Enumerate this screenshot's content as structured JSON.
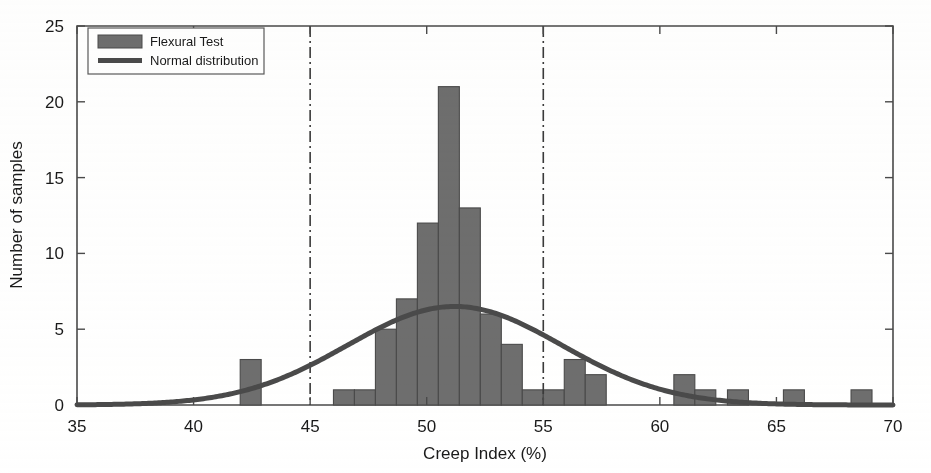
{
  "chart_data": {
    "type": "bar",
    "title": "",
    "subtitle": "",
    "xlabel": "Creep Index (%)",
    "ylabel": "Number of samples",
    "xlim": [
      35,
      70
    ],
    "ylim": [
      0,
      25
    ],
    "xticks": [
      35,
      40,
      45,
      50,
      55,
      60,
      65,
      70
    ],
    "xticklabels": [
      "35",
      "40",
      "45",
      "50",
      "55",
      "60",
      "65",
      "70"
    ],
    "yticks": [
      0,
      5,
      10,
      15,
      20,
      25
    ],
    "yticklabels": [
      "0",
      "5",
      "10",
      "15",
      "20",
      "25"
    ],
    "grid": false,
    "legend_position": "upper left",
    "legend": [
      {
        "label": "Flexural Test",
        "type": "bar",
        "color": "#6e6e6e"
      },
      {
        "label": "Normal distribution",
        "type": "line",
        "color": "#4a4a4a"
      }
    ],
    "bin_width": 0.9,
    "bars": [
      {
        "x_left": 42.0,
        "x_right": 42.9,
        "value": 3
      },
      {
        "x_left": 46.0,
        "x_right": 46.9,
        "value": 1
      },
      {
        "x_left": 46.9,
        "x_right": 47.8,
        "value": 1
      },
      {
        "x_left": 47.8,
        "x_right": 48.7,
        "value": 5
      },
      {
        "x_left": 48.7,
        "x_right": 49.6,
        "value": 7
      },
      {
        "x_left": 49.6,
        "x_right": 50.5,
        "value": 12
      },
      {
        "x_left": 50.5,
        "x_right": 51.4,
        "value": 21
      },
      {
        "x_left": 51.4,
        "x_right": 52.3,
        "value": 13
      },
      {
        "x_left": 52.3,
        "x_right": 53.2,
        "value": 6
      },
      {
        "x_left": 53.2,
        "x_right": 54.1,
        "value": 4
      },
      {
        "x_left": 54.1,
        "x_right": 55.0,
        "value": 1
      },
      {
        "x_left": 55.0,
        "x_right": 55.9,
        "value": 1
      },
      {
        "x_left": 55.9,
        "x_right": 56.8,
        "value": 3
      },
      {
        "x_left": 56.8,
        "x_right": 57.7,
        "value": 2
      },
      {
        "x_left": 60.6,
        "x_right": 61.5,
        "value": 2
      },
      {
        "x_left": 61.5,
        "x_right": 62.4,
        "value": 1
      },
      {
        "x_left": 62.9,
        "x_right": 63.8,
        "value": 1
      },
      {
        "x_left": 65.3,
        "x_right": 66.2,
        "value": 1
      },
      {
        "x_left": 68.2,
        "x_right": 69.1,
        "value": 1
      }
    ],
    "normal_curve": {
      "name": "Normal distribution",
      "mean": 51.2,
      "sigma": 4.6,
      "peak_value": 6.5,
      "x_start": 35,
      "x_end": 70,
      "color": "#4a4a4a"
    },
    "vertical_reference_lines": [
      {
        "x": 45,
        "style": "dash-dot",
        "color": "#3a3a3a"
      },
      {
        "x": 55,
        "style": "dash-dot",
        "color": "#3a3a3a"
      }
    ],
    "annotations": []
  },
  "axes": {
    "x_axis_label": "Creep Index (%)",
    "y_axis_label": "Number of samples"
  }
}
